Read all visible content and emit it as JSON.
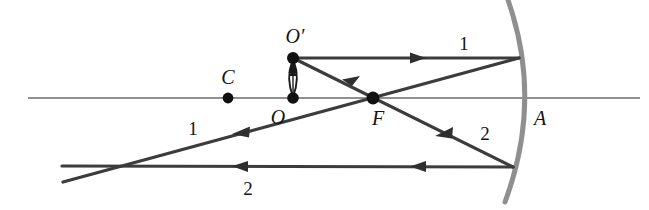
{
  "figure": {
    "type": "optics-ray-diagram",
    "width": 649,
    "height": 210,
    "background_color": "#ffffff",
    "line_color": "#4a4a4a",
    "ray_color": "#3c3c3c",
    "axis_color": "#6b6b6b",
    "mirror_color": "#8c8c8c",
    "point_color": "#111111"
  },
  "labels": {
    "object_top": "O′",
    "object_base": "O",
    "center_of_curvature": "C",
    "focal_point": "F",
    "mirror_vertex": "A",
    "ray1_incident": "1",
    "ray1_reflected": "1",
    "ray2_incident": "2",
    "ray2_reflected": "2"
  },
  "points": [
    {
      "name": "C",
      "label": "C",
      "x": 228,
      "y": 98,
      "label_x": 228,
      "label_y": 77
    },
    {
      "name": "O",
      "label": "O",
      "x": 293,
      "y": 98,
      "label_x": 278,
      "label_y": 117
    },
    {
      "name": "Op",
      "label": "O′",
      "x": 293,
      "y": 58,
      "label_x": 295,
      "label_y": 36
    },
    {
      "name": "F",
      "label": "F",
      "x": 373,
      "y": 98,
      "label_x": 378,
      "label_y": 118
    },
    {
      "name": "A",
      "label": "A",
      "x": 528,
      "y": 98,
      "label_x": 540,
      "label_y": 118
    }
  ],
  "ray_labels": [
    {
      "name": "ray1-incident-label",
      "text": "1",
      "x": 464,
      "y": 43
    },
    {
      "name": "ray1-reflected-label",
      "text": "1",
      "x": 193,
      "y": 128
    },
    {
      "name": "ray2-reflected-label",
      "text": "2",
      "x": 485,
      "y": 133
    },
    {
      "name": "ray2-horizontal-label",
      "text": "2",
      "x": 248,
      "y": 188
    }
  ],
  "geometry": {
    "axis": {
      "x1": 28,
      "y1": 98,
      "x2": 640,
      "y2": 98
    },
    "mirror_arc": {
      "start_x": 508,
      "start_y": 0,
      "vertex_x": 528,
      "vertex_y": 98,
      "end_x": 505,
      "end_y": 202
    },
    "object_arrow": {
      "x": 293,
      "y_base": 98,
      "y_tip": 58
    },
    "ray1_incident": {
      "x1": 293,
      "y1": 58,
      "x2": 519,
      "y2": 58
    },
    "ray1_reflected": {
      "x1": 519,
      "y1": 58,
      "x2": 63,
      "y2": 182
    },
    "ray2_incident": {
      "x1": 293,
      "y1": 58,
      "x2": 513,
      "y2": 167
    },
    "ray2_reflected": {
      "x1": 513,
      "y1": 167,
      "x2": 62,
      "y2": 166
    }
  },
  "arrow_markers": [
    {
      "name": "ray1-incident-arrow",
      "x": 418,
      "y": 58,
      "direction": "right"
    },
    {
      "name": "ray1-reflected-arrow",
      "x": 240,
      "y": 131,
      "direction": "left-down"
    },
    {
      "name": "ray2-incident-arrow",
      "x": 443,
      "y": 132,
      "direction": "left-up"
    },
    {
      "name": "ray2-reflected-arrow-1",
      "x": 418,
      "y": 167,
      "direction": "left"
    },
    {
      "name": "ray2-reflected-arrow-2",
      "x": 240,
      "y": 166,
      "direction": "left"
    },
    {
      "name": "reflected-upper-arrow",
      "x": 350,
      "y": 77,
      "direction": "left-up"
    }
  ]
}
